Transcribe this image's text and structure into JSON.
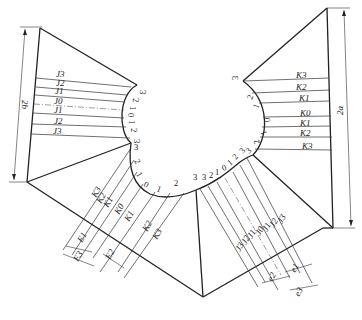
{
  "figure": {
    "dimensions": {
      "left_height": "2b",
      "right_height": "2a"
    },
    "left_panel": {
      "labels": [
        "J3",
        "J2",
        "J1",
        "J0",
        "J1",
        "J2",
        "J3"
      ],
      "profile_numbers": [
        "3",
        "2",
        "1",
        "0",
        "1",
        "2",
        "3"
      ]
    },
    "right_panel": {
      "labels": [
        "K3",
        "K2",
        "K1",
        "K0",
        "K1",
        "K2",
        "K3"
      ],
      "profile_numbers": [
        "3",
        "2",
        "1",
        "0",
        "1",
        "2",
        "3"
      ]
    },
    "bottom_left_panel": {
      "labels": [
        "K3",
        "K2",
        "K1",
        "K0",
        "K1",
        "K2",
        "K3"
      ],
      "profile_numbers": [
        "3",
        "2",
        "1",
        "0",
        "1",
        "2",
        "3"
      ],
      "spacing_labels": [
        "E1",
        "E2",
        "E3"
      ]
    },
    "bottom_right_panel": {
      "labels": [
        "J3",
        "J2",
        "J1",
        "J0",
        "J1",
        "J2",
        "J3"
      ],
      "profile_numbers": [
        "3",
        "2",
        "1",
        "0",
        "1",
        "2",
        "3"
      ],
      "spacing_labels": [
        "e1",
        "e2",
        "e3"
      ]
    }
  }
}
